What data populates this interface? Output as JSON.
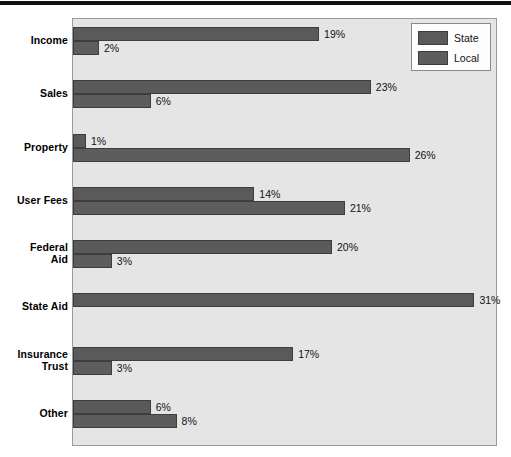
{
  "chart_data": {
    "type": "bar",
    "orientation": "horizontal",
    "title": "",
    "xlabel": "",
    "ylabel": "",
    "xlim": [
      0,
      32
    ],
    "grid": false,
    "legend_position": "top-right",
    "categories": [
      "Income",
      "Sales",
      "Property",
      "User Fees",
      "Federal Aid",
      "State Aid",
      "Insurance Trust",
      "Other"
    ],
    "series": [
      {
        "name": "State",
        "color": "#5a5a5a",
        "values": [
          19,
          23,
          1,
          14,
          20,
          31,
          17,
          6
        ],
        "labels": [
          "19%",
          "23%",
          "1%",
          "14%",
          "20%",
          "31%",
          "17%",
          "6%"
        ]
      },
      {
        "name": "Local",
        "color": "#5d5d5d",
        "values": [
          2,
          6,
          26,
          21,
          3,
          0,
          3,
          8
        ],
        "labels": [
          "2%",
          "6%",
          "26%",
          "21%",
          "3%",
          "",
          "3%",
          "8%"
        ]
      }
    ]
  },
  "legend": {
    "entries": [
      {
        "label": "State",
        "color": "#5a5a5a"
      },
      {
        "label": "Local",
        "color": "#5d5d5d"
      }
    ]
  },
  "colors": {
    "plot_background": "#e5e5e5",
    "plot_border": "#9a9a9a",
    "bar_state": "#5a5a5a",
    "bar_local": "#5d5d5d",
    "bar_outline": "#3d3d3d",
    "text": "#111111",
    "top_rule": "#111111",
    "legend_background": "#fdfdfd"
  }
}
